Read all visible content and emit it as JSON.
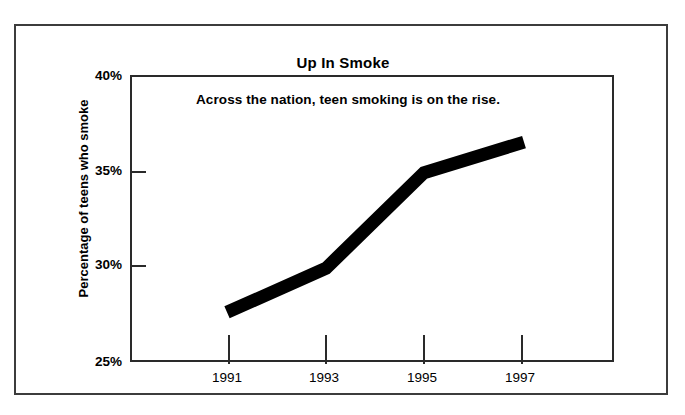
{
  "chart_data": {
    "type": "line",
    "title": "Up In Smoke",
    "annotation": "Across the nation, teen smoking is on the rise.",
    "xlabel": "",
    "ylabel": "Percentage of teens who smoke",
    "categories": [
      "1991",
      "1993",
      "1995",
      "1997"
    ],
    "x": [
      1991,
      1993,
      1995,
      1997
    ],
    "values": [
      27.7,
      30.0,
      35.0,
      36.6
    ],
    "series": [
      {
        "name": "Percentage of teens who smoke",
        "values": [
          27.7,
          30.0,
          35.0,
          36.6
        ]
      }
    ],
    "ylim": [
      25,
      40
    ],
    "xlim": [
      1991,
      1997
    ],
    "y_ticks": [
      25,
      30,
      35,
      40
    ],
    "y_tick_labels": [
      "25%",
      "30%",
      "35%",
      "40%"
    ],
    "x_ticks": [
      1991,
      1993,
      1995,
      1997
    ],
    "x_tick_labels": [
      "1991",
      "1993",
      "1995",
      "1997"
    ],
    "grid": false,
    "legend": "none",
    "line_color": "#000000",
    "line_width_px": 13,
    "axis_color": "#2a2a2a",
    "background_color": "#ffffff",
    "frame_color": "#3c3c3c"
  },
  "figure": {
    "title": "Up In Smoke",
    "annotation": "Across the nation, teen smoking is on the rise.",
    "y_axis_title": "Percentage of teens who smoke",
    "y_tick_labels": [
      "40%",
      "35%",
      "30%",
      "25%"
    ],
    "x_tick_labels": [
      "1991",
      "1993",
      "1995",
      "1997"
    ]
  }
}
